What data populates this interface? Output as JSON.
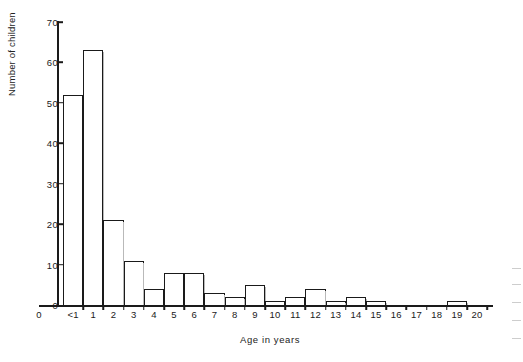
{
  "chart_data": {
    "type": "bar",
    "title": "",
    "subtitle": "",
    "xlabel": "Age in years",
    "ylabel": "Number of children",
    "categories": [
      "<1",
      "1",
      "2",
      "3",
      "4",
      "5",
      "6",
      "7",
      "8",
      "9",
      "10",
      "11",
      "12",
      "13",
      "14",
      "15",
      "16",
      "17",
      "18",
      "19",
      "20"
    ],
    "values": [
      52,
      63,
      21,
      11,
      4,
      8,
      8,
      3,
      2,
      5,
      1,
      2,
      4,
      1,
      2,
      1,
      0,
      0,
      0,
      1,
      0
    ],
    "ylim": [
      0,
      70
    ],
    "yticks": [
      0,
      10,
      20,
      30,
      40,
      50,
      60,
      70
    ],
    "ytick_labels": [
      "0",
      "10",
      "20",
      "30",
      "40",
      "50",
      "60",
      "70"
    ],
    "xtick_labels": [
      "0",
      "<1",
      "1",
      "2",
      "3",
      "4",
      "5",
      "6",
      "7",
      "8",
      "9",
      "10",
      "11",
      "12",
      "13",
      "14",
      "15",
      "16",
      "17",
      "18",
      "19",
      "20"
    ],
    "grid": false,
    "legend": null,
    "legend_position": "none",
    "bar_fill_color": "#ffffff",
    "bar_edge_color": "#1a1a1a",
    "axis_color": "#1a1a1a",
    "background_color": "#ffffff"
  },
  "axes": {
    "y_title": "Number of children",
    "x_title": "Age in years",
    "origin_label": "0"
  }
}
